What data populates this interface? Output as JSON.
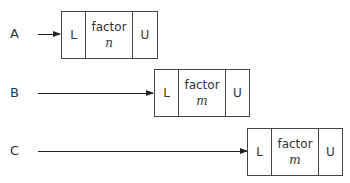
{
  "rows": [
    {
      "label": "A",
      "left": "L",
      "factor": "factor",
      "var": "n",
      "right": "U"
    },
    {
      "label": "B",
      "left": "L",
      "factor": "factor",
      "var": "m",
      "right": "U"
    },
    {
      "label": "C",
      "left": "L",
      "factor": "factor",
      "var": "m",
      "right": "U"
    }
  ]
}
